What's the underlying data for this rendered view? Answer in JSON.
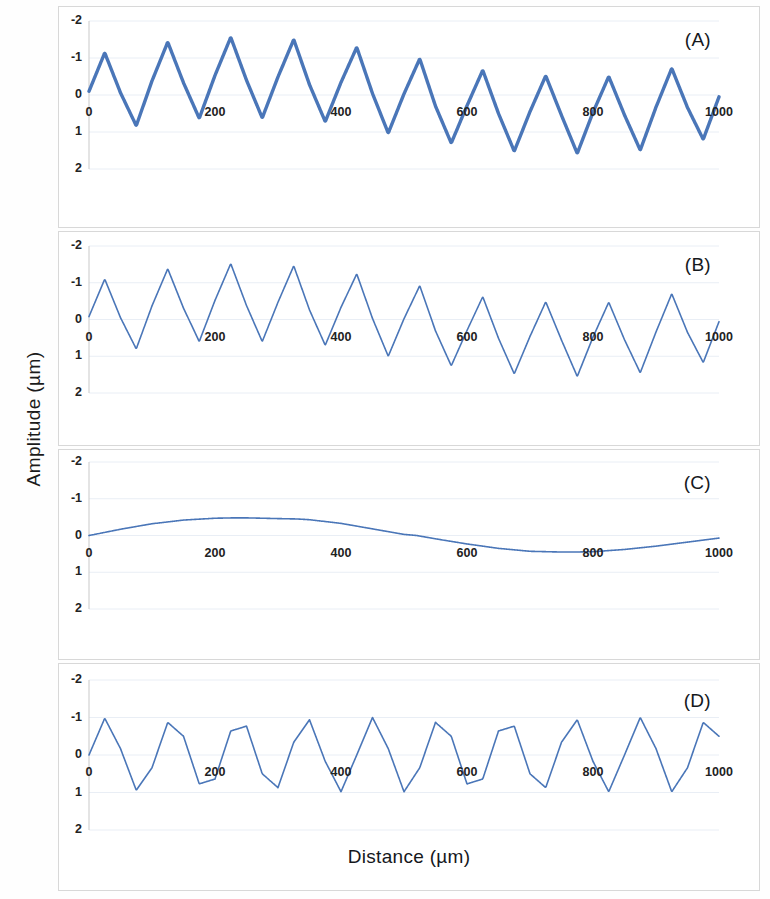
{
  "figure": {
    "axis_titles": {
      "y": "Amplitude (µm)",
      "x": "Distance (µm)"
    },
    "line_color": "#4a76b8",
    "grid_color": "#e9eef5",
    "border_color": "#d8d8d8",
    "background": "#ffffff"
  },
  "chart_data": [
    {
      "type": "line",
      "panel": "(A)",
      "title": "",
      "xlabel": "",
      "ylabel": "Amplitude (µm)",
      "xlim": [
        0,
        1000
      ],
      "ylim": [
        -2,
        2
      ],
      "xticks": [
        0,
        200,
        400,
        600,
        800,
        1000
      ],
      "yticks": [
        -2,
        -1,
        0,
        1,
        2
      ],
      "grid": true,
      "legend": null,
      "description": "Noisy measured signal: unit sine plus slow drift plus high-frequency noise",
      "noise": true,
      "noise_amplitude": 0.06,
      "components": {
        "sine_amplitude": 1.0,
        "sine_period": 90.0,
        "drift": "panel_C"
      },
      "x": [
        0,
        25,
        50,
        75,
        100,
        125,
        150,
        175,
        200,
        225,
        250,
        275,
        300,
        325,
        350,
        375,
        400,
        425,
        450,
        475,
        500,
        525,
        550,
        575,
        600,
        625,
        650,
        675,
        700,
        725,
        750,
        775,
        800,
        825,
        850,
        875,
        900,
        925,
        950,
        975,
        1000
      ],
      "values": [
        0.1,
        1.14,
        0.06,
        -0.83,
        0.38,
        1.43,
        0.33,
        -0.63,
        0.53,
        1.56,
        0.4,
        -0.62,
        0.49,
        1.5,
        0.28,
        -0.72,
        0.34,
        1.29,
        0.04,
        -1.03,
        0.03,
        0.98,
        -0.3,
        -1.3,
        -0.29,
        0.67,
        -0.5,
        -1.52,
        -0.45,
        0.52,
        -0.55,
        -1.58,
        -0.47,
        0.5,
        -0.54,
        -1.49,
        -0.33,
        0.72,
        -0.34,
        -1.2,
        -0.05
      ]
    },
    {
      "type": "line",
      "panel": "(B)",
      "title": "",
      "xlabel": "",
      "ylabel": "Amplitude (µm)",
      "xlim": [
        0,
        1000
      ],
      "ylim": [
        -2,
        2
      ],
      "xticks": [
        0,
        200,
        400,
        600,
        800,
        1000
      ],
      "yticks": [
        -2,
        -1,
        0,
        1,
        2
      ],
      "grid": true,
      "legend": null,
      "description": "Denoised signal: unit sine plus slow drift, smooth line",
      "noise": false,
      "components": {
        "sine_amplitude": 1.0,
        "sine_period": 90.0,
        "drift": "panel_C"
      },
      "x": [
        0,
        25,
        50,
        75,
        100,
        125,
        150,
        175,
        200,
        225,
        250,
        275,
        300,
        325,
        350,
        375,
        400,
        425,
        450,
        475,
        500,
        525,
        550,
        575,
        600,
        625,
        650,
        675,
        700,
        725,
        750,
        775,
        800,
        825,
        850,
        875,
        900,
        925,
        950,
        975,
        1000
      ],
      "values": [
        0.08,
        1.1,
        0.05,
        -0.8,
        0.37,
        1.38,
        0.31,
        -0.6,
        0.52,
        1.52,
        0.38,
        -0.6,
        0.47,
        1.46,
        0.26,
        -0.7,
        0.33,
        1.24,
        0.03,
        -1.0,
        0.02,
        0.92,
        -0.31,
        -1.26,
        -0.3,
        0.62,
        -0.51,
        -1.48,
        -0.46,
        0.48,
        -0.56,
        -1.55,
        -0.48,
        0.47,
        -0.55,
        -1.45,
        -0.34,
        0.7,
        -0.35,
        -1.17,
        -0.06
      ]
    },
    {
      "type": "line",
      "panel": "(C)",
      "title": "",
      "xlabel": "",
      "ylabel": "Amplitude (µm)",
      "xlim": [
        0,
        1000
      ],
      "ylim": [
        -2,
        2
      ],
      "xticks": [
        0,
        200,
        400,
        600,
        800,
        1000
      ],
      "yticks": [
        -2,
        -1,
        0,
        1,
        2
      ],
      "grid": true,
      "legend": null,
      "description": "Extracted slow drift / baseline component, one long period",
      "noise": false,
      "x": [
        0,
        50,
        100,
        150,
        200,
        230,
        250,
        300,
        330,
        350,
        400,
        450,
        500,
        520,
        550,
        600,
        650,
        700,
        750,
        770,
        800,
        850,
        900,
        950,
        1000
      ],
      "values": [
        0.0,
        0.17,
        0.32,
        0.42,
        0.47,
        0.48,
        0.48,
        0.46,
        0.45,
        0.43,
        0.33,
        0.18,
        0.03,
        0.0,
        -0.09,
        -0.23,
        -0.35,
        -0.43,
        -0.45,
        -0.45,
        -0.44,
        -0.38,
        -0.29,
        -0.18,
        -0.07
      ]
    },
    {
      "type": "line",
      "panel": "(D)",
      "title": "",
      "xlabel": "Distance (µm)",
      "ylabel": "Amplitude (µm)",
      "xlim": [
        0,
        1000
      ],
      "ylim": [
        -2,
        2
      ],
      "xticks": [
        0,
        200,
        400,
        600,
        800,
        1000
      ],
      "yticks": [
        -2,
        -1,
        0,
        1,
        2
      ],
      "grid": true,
      "legend": null,
      "description": "Recovered pure sinusoid, unit amplitude, constant period",
      "noise": false,
      "components": {
        "sine_amplitude": 1.0,
        "sine_period": 90.0,
        "phase_deg": 0,
        "cycles": 11.1
      },
      "x": [
        0,
        25,
        50,
        75,
        100,
        125,
        150,
        175,
        200,
        225,
        250,
        275,
        300,
        325,
        350,
        375,
        400,
        425,
        450,
        475,
        500,
        525,
        550,
        575,
        600,
        625,
        650,
        675,
        700,
        725,
        750,
        775,
        800,
        825,
        850,
        875,
        900,
        925,
        950,
        975,
        1000
      ],
      "values": [
        0.0,
        0.98,
        0.17,
        -0.94,
        -0.34,
        0.87,
        0.5,
        -0.77,
        -0.64,
        0.64,
        0.77,
        -0.5,
        -0.87,
        0.34,
        0.94,
        -0.17,
        -0.98,
        0.0,
        1.0,
        0.17,
        -0.98,
        -0.34,
        0.87,
        0.5,
        -0.77,
        -0.64,
        0.64,
        0.77,
        -0.5,
        -0.87,
        0.34,
        0.94,
        -0.17,
        -0.98,
        0.0,
        1.0,
        0.17,
        -0.98,
        -0.34,
        0.87,
        0.5
      ]
    }
  ],
  "panels": [
    {
      "label": "(A)",
      "ytick_labels": [
        "2",
        "1",
        "0",
        "-1",
        "-2"
      ],
      "xtick_labels": [
        "0",
        "200",
        "400",
        "600",
        "800",
        "1000"
      ]
    },
    {
      "label": "(B)",
      "ytick_labels": [
        "2",
        "1",
        "0",
        "-1",
        "-2"
      ],
      "xtick_labels": [
        "0",
        "200",
        "400",
        "600",
        "800",
        "1000"
      ]
    },
    {
      "label": "(C)",
      "ytick_labels": [
        "2",
        "1",
        "0",
        "-1",
        "-2"
      ],
      "xtick_labels": [
        "0",
        "200",
        "400",
        "600",
        "800",
        "1000"
      ]
    },
    {
      "label": "(D)",
      "ytick_labels": [
        "2",
        "1",
        "0",
        "-1",
        "-2"
      ],
      "xtick_labels": [
        "0",
        "200",
        "400",
        "600",
        "800",
        "1000"
      ]
    }
  ]
}
